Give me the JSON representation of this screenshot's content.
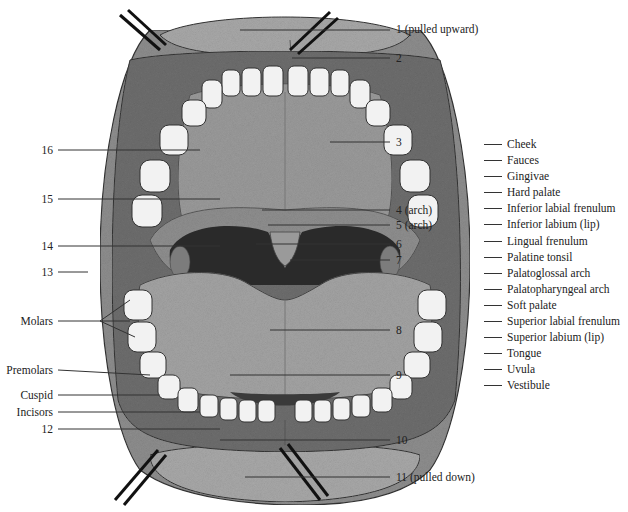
{
  "figure": {
    "numbered_labels": [
      {
        "id": "1",
        "text": "1 (pulled upward)"
      },
      {
        "id": "2",
        "text": "2"
      },
      {
        "id": "3",
        "text": "3"
      },
      {
        "id": "4",
        "text": "4 (arch)"
      },
      {
        "id": "5",
        "text": "5 (arch)"
      },
      {
        "id": "6",
        "text": "6"
      },
      {
        "id": "7",
        "text": "7"
      },
      {
        "id": "8",
        "text": "8"
      },
      {
        "id": "9",
        "text": "9"
      },
      {
        "id": "10",
        "text": "10"
      },
      {
        "id": "11",
        "text": "11 (pulled down)"
      },
      {
        "id": "12",
        "text": "12"
      },
      {
        "id": "13",
        "text": "13"
      },
      {
        "id": "14",
        "text": "14"
      },
      {
        "id": "15",
        "text": "15"
      },
      {
        "id": "16",
        "text": "16"
      }
    ],
    "teeth_labels": [
      "Molars",
      "Premolars",
      "Cuspid",
      "Incisors"
    ],
    "word_bank": [
      "Cheek",
      "Fauces",
      "Gingivae",
      "Hard palate",
      "Inferior labial frenulum",
      "Inferior labium (lip)",
      "Lingual frenulum",
      "Palatine tonsil",
      "Palatoglossal arch",
      "Palatopharyngeal arch",
      "Soft palate",
      "Superior labial frenulum",
      "Superior labium (lip)",
      "Tongue",
      "Uvula",
      "Vestibule"
    ]
  },
  "colors": {
    "background": "#ffffff",
    "cheek": "#8e8e8e",
    "lip": "#a9a9a9",
    "gum": "#7a7a7a",
    "palate": "#9b9b9b",
    "throat": "#2a2a2a",
    "tongue": "#a4a4a4",
    "tooth": "#f2f2f2",
    "leader": "#333333"
  }
}
